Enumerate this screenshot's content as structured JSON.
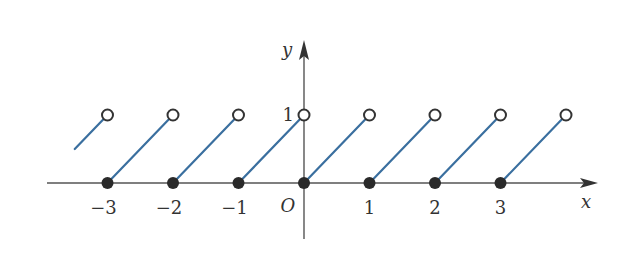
{
  "chart_data": {
    "type": "line",
    "title": "",
    "function": "y = x - floor(x)",
    "xlabel": "x",
    "ylabel": "y",
    "origin_label": "O",
    "x_ticks": [
      -3,
      -2,
      -1,
      1,
      2,
      3
    ],
    "x_tick_labels": [
      "−3",
      "−2",
      "−1",
      "1",
      "2",
      "3"
    ],
    "y_ticks": [
      1
    ],
    "y_tick_labels": [
      "1"
    ],
    "xlim": [
      -3.9,
      4.5
    ],
    "ylim": [
      -0.8,
      2.1
    ],
    "grid": false,
    "segments": [
      {
        "x": [
          -3.5,
          -3
        ],
        "y": [
          0.5,
          1
        ],
        "start": "none",
        "end": "open"
      },
      {
        "x": [
          -3,
          -2
        ],
        "y": [
          0,
          1
        ],
        "start": "closed",
        "end": "open"
      },
      {
        "x": [
          -2,
          -1
        ],
        "y": [
          0,
          1
        ],
        "start": "closed",
        "end": "open"
      },
      {
        "x": [
          -1,
          0
        ],
        "y": [
          0,
          1
        ],
        "start": "closed",
        "end": "open"
      },
      {
        "x": [
          0,
          1
        ],
        "y": [
          0,
          1
        ],
        "start": "closed",
        "end": "open"
      },
      {
        "x": [
          1,
          2
        ],
        "y": [
          0,
          1
        ],
        "start": "closed",
        "end": "open"
      },
      {
        "x": [
          2,
          3
        ],
        "y": [
          0,
          1
        ],
        "start": "closed",
        "end": "open"
      },
      {
        "x": [
          3,
          4
        ],
        "y": [
          0,
          1
        ],
        "start": "closed",
        "end": "open"
      }
    ],
    "colors": {
      "line": "#3a6f9f",
      "axis": "#555555",
      "point": "#2a2a2a"
    }
  }
}
